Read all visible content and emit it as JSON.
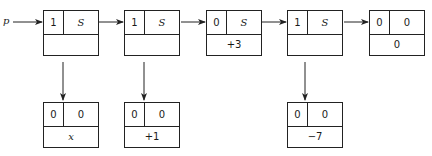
{
  "pointer_label": "p",
  "top_row": [
    {
      "tag": "1",
      "field": "S",
      "value": ""
    },
    {
      "tag": "1",
      "field": "S",
      "value": ""
    },
    {
      "tag": "0",
      "field": "S",
      "value": "+3"
    },
    {
      "tag": "1",
      "field": "S",
      "value": ""
    },
    {
      "tag": "0",
      "field": "0",
      "value": "0"
    }
  ],
  "bottom_row": [
    {
      "tag": "0",
      "field": "0",
      "value": "x",
      "under_node": 1
    },
    {
      "tag": "0",
      "field": "0",
      "value": "+1",
      "under_node": 2
    },
    {
      "tag": "0",
      "field": "0",
      "value": "−7",
      "under_node": 4
    }
  ]
}
